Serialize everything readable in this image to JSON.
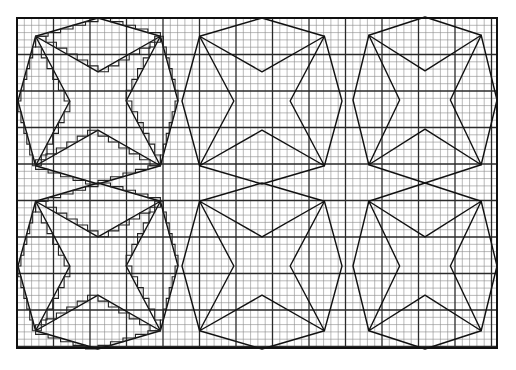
{
  "diagram": {
    "paper": {
      "background": "#ffffff",
      "grid_minor_color": "#8a8a8a",
      "grid_major_color": "#2a2a2a",
      "line_color": "#111111",
      "frame": {
        "x": 17,
        "y": 18,
        "width": 480,
        "height": 330
      },
      "cell_size": 7.3,
      "major_every": 5
    },
    "layout": {
      "columns": 3,
      "rows": 2
    },
    "figures": [
      {
        "id": "fig-r1-c1",
        "cx": 98,
        "cy": 101,
        "half_w": 80,
        "half_h": 83,
        "stepped_overlay": true
      },
      {
        "id": "fig-r1-c2",
        "cx": 262,
        "cy": 101,
        "half_w": 80,
        "half_h": 83,
        "stepped_overlay": false
      },
      {
        "id": "fig-r1-c3",
        "cx": 425,
        "cy": 100,
        "half_w": 72,
        "half_h": 83,
        "stepped_overlay": false
      },
      {
        "id": "fig-r2-c1",
        "cx": 98,
        "cy": 266,
        "half_w": 80,
        "half_h": 83,
        "stepped_overlay": true
      },
      {
        "id": "fig-r2-c2",
        "cx": 262,
        "cy": 266,
        "half_w": 80,
        "half_h": 83,
        "stepped_overlay": false
      },
      {
        "id": "fig-r2-c3",
        "cx": 425,
        "cy": 266,
        "half_w": 72,
        "half_h": 83,
        "stepped_overlay": false
      }
    ]
  }
}
